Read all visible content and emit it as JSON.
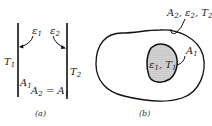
{
  "figure": {
    "panel_a": {
      "caption": "(a)",
      "left_plate": {
        "temperature": "T",
        "temperature_sub": "1",
        "emissivity": "ε",
        "emissivity_sub": "1",
        "area": "A",
        "area_sub": "1"
      },
      "right_plate": {
        "temperature": "T",
        "temperature_sub": "2",
        "emissivity": "ε",
        "emissivity_sub": "2"
      },
      "area_relation": {
        "lhs": "A",
        "lhs_sub": "2",
        "eq": " = A",
        "rhs_sub": "1"
      }
    },
    "panel_b": {
      "caption": "(b)",
      "outer_label": {
        "a": "A",
        "a_sub": "2",
        "e": ", ε",
        "e_sub": "2",
        "t": ", T",
        "t_sub": "2"
      },
      "inner_area": {
        "a": "A",
        "a_sub": "1"
      },
      "inner_label": {
        "e": "ε",
        "e_sub": "1",
        "t": ", T",
        "t_sub": "1"
      }
    },
    "colors": {
      "line": "#111111",
      "shade": "#bbbbbb",
      "background": "#ffffff"
    }
  }
}
